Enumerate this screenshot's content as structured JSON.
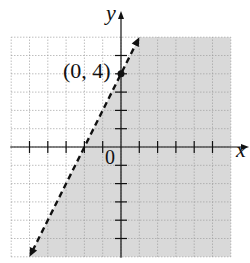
{
  "chart_data": {
    "type": "line",
    "title": "",
    "subtitle": "",
    "xlabel": "x",
    "ylabel": "y",
    "xlim": [
      -6,
      6
    ],
    "ylim": [
      -6,
      6
    ],
    "grid": true,
    "legend": null,
    "series": [
      {
        "name": "boundary y = 2x + 4",
        "style": "dashed",
        "x": [
          -5,
          1
        ],
        "y": [
          -6,
          6
        ]
      }
    ],
    "shaded_region": {
      "description": "y < 2x + 4 (region to the right/below of the dashed line)",
      "color": "#d9d9d9"
    },
    "points": [
      {
        "x": 0,
        "y": 4,
        "label": "(0, 4)"
      }
    ],
    "x_intercept": -2,
    "y_intercept": 4,
    "origin_label": "0"
  },
  "labels": {
    "x_axis": "x",
    "y_axis": "y",
    "origin": "0",
    "point": "(0, 4)"
  },
  "colors": {
    "shade": "#d9d9d9",
    "grid": "#9a9a9a",
    "axis": "#111111",
    "line": "#111111"
  }
}
